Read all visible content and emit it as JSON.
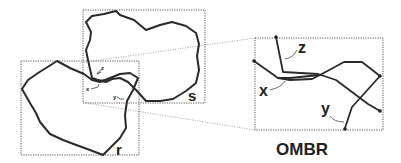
{
  "diagram": {
    "labels": {
      "polygon_s": "s",
      "polygon_r": "r",
      "overlap_box": "OMBR",
      "small_x": "x",
      "small_y": "y",
      "small_z": "z",
      "zoom_x": "x",
      "zoom_y": "y",
      "zoom_z": "z"
    },
    "colors": {
      "stroke": "#2a2a2a",
      "mbr_dotted": "#555555",
      "background": "#ffffff"
    }
  }
}
